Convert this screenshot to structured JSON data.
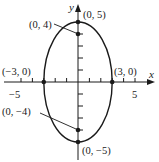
{
  "figure": {
    "type": "ellipse-graph",
    "equation_form": "x^2/9 + y^2/25 = 1",
    "axes": {
      "x_label": "x",
      "y_label": "y",
      "x_tick_labels": {
        "neg": "−5",
        "pos": "5"
      }
    },
    "points": [
      {
        "id": "top_vertex",
        "label": "(0, 5)"
      },
      {
        "id": "top_focus",
        "label": "(0, 4)"
      },
      {
        "id": "left_covertex",
        "label": "(−3, 0)"
      },
      {
        "id": "right_covertex",
        "label": "(3, 0)"
      },
      {
        "id": "bottom_focus",
        "label": "(0, −4)"
      },
      {
        "id": "bottom_vertex",
        "label": "(0, −5)"
      }
    ],
    "colors": {
      "stroke": "#1a1a1a",
      "background": "#ffffff"
    }
  }
}
